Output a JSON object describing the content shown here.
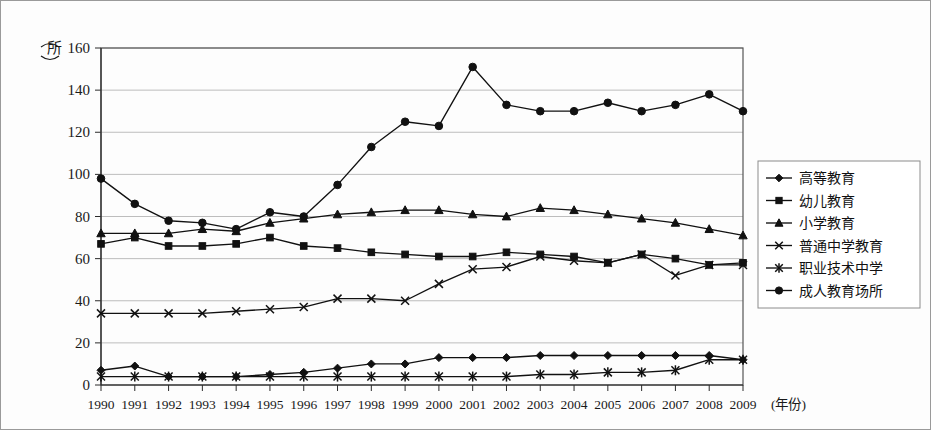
{
  "chart_data": {
    "type": "line",
    "title": "",
    "xlabel": "(年份)",
    "ylabel": "(所)",
    "ylim": [
      0,
      160
    ],
    "yticks": [
      0,
      20,
      40,
      60,
      80,
      100,
      120,
      140,
      160
    ],
    "grid": true,
    "legend_position": "right",
    "categories": [
      "1990",
      "1991",
      "1992",
      "1993",
      "1994",
      "1995",
      "1996",
      "1997",
      "1998",
      "1999",
      "2000",
      "2001",
      "2002",
      "2003",
      "2004",
      "2005",
      "2006",
      "2007",
      "2008",
      "2009"
    ],
    "series": [
      {
        "name": "高等教育",
        "marker": "diamond",
        "values": [
          7,
          9,
          4,
          4,
          4,
          5,
          6,
          8,
          10,
          10,
          13,
          13,
          13,
          14,
          14,
          14,
          14,
          14,
          14,
          12
        ]
      },
      {
        "name": "幼儿教育",
        "marker": "square",
        "values": [
          67,
          70,
          66,
          66,
          67,
          70,
          66,
          65,
          63,
          62,
          61,
          61,
          63,
          62,
          61,
          58,
          62,
          60,
          57,
          58
        ]
      },
      {
        "name": "小学教育",
        "marker": "triangle",
        "values": [
          72,
          72,
          72,
          74,
          73,
          77,
          79,
          81,
          82,
          83,
          83,
          81,
          80,
          84,
          83,
          81,
          79,
          77,
          74,
          71
        ]
      },
      {
        "name": "普通中学教育",
        "marker": "cross",
        "values": [
          34,
          34,
          34,
          34,
          35,
          36,
          37,
          41,
          41,
          40,
          48,
          55,
          56,
          61,
          59,
          58,
          62,
          52,
          57,
          57
        ]
      },
      {
        "name": "职业技术中学",
        "marker": "star",
        "values": [
          4,
          4,
          4,
          4,
          4,
          4,
          4,
          4,
          4,
          4,
          4,
          4,
          4,
          5,
          5,
          6,
          6,
          7,
          12,
          12
        ]
      },
      {
        "name": "成人教育场所",
        "marker": "circle",
        "values": [
          98,
          86,
          78,
          77,
          74,
          82,
          80,
          95,
          113,
          125,
          123,
          151,
          133,
          130,
          130,
          134,
          130,
          133,
          138,
          130
        ]
      }
    ]
  },
  "legend": {
    "items": [
      {
        "label": "高等教育",
        "marker": "diamond"
      },
      {
        "label": "幼儿教育",
        "marker": "square"
      },
      {
        "label": "小学教育",
        "marker": "triangle"
      },
      {
        "label": "普通中学教育",
        "marker": "cross"
      },
      {
        "label": "职业技术中学",
        "marker": "star"
      },
      {
        "label": "成人教育场所",
        "marker": "circle"
      }
    ]
  },
  "colors": {
    "series": "#111111",
    "grid": "#bdbdbd",
    "axis": "#2b2b2b",
    "background": "#fdfdfd"
  }
}
